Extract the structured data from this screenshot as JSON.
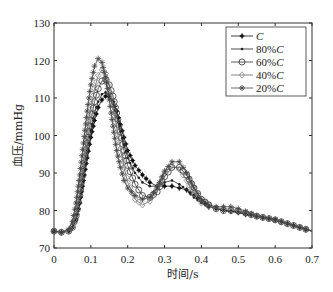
{
  "chart_data": {
    "type": "line",
    "title": "",
    "xlabel": "时间/s",
    "ylabel": "血压/mmHg",
    "xlim": [
      0,
      0.7
    ],
    "ylim": [
      70,
      130
    ],
    "xticks": [
      "0",
      "0.1",
      "0.2",
      "0.3",
      "0.4",
      "0.5",
      "0.6",
      "0.7"
    ],
    "yticks": [
      "70",
      "80",
      "90",
      "100",
      "110",
      "120",
      "130"
    ],
    "grid": false,
    "legend_position": "upper right",
    "x": [
      0,
      0.02,
      0.04,
      0.05,
      0.06,
      0.07,
      0.08,
      0.09,
      0.1,
      0.11,
      0.12,
      0.13,
      0.14,
      0.15,
      0.16,
      0.17,
      0.18,
      0.19,
      0.2,
      0.22,
      0.24,
      0.26,
      0.28,
      0.3,
      0.32,
      0.34,
      0.36,
      0.38,
      0.4,
      0.42,
      0.44,
      0.46,
      0.48,
      0.5,
      0.52,
      0.55,
      0.6,
      0.65,
      0.7
    ],
    "series": [
      {
        "name": "C",
        "marker": "dot-star",
        "values": [
          74.5,
          74.2,
          74.5,
          75.5,
          77.5,
          82,
          88,
          94,
          99.5,
          104,
          107.5,
          109.5,
          110.5,
          110.3,
          109,
          106.5,
          103,
          99.5,
          96,
          92,
          89.5,
          87.5,
          86.5,
          86.5,
          86.5,
          86,
          85.5,
          84,
          82.5,
          81,
          80.5,
          80,
          79.8,
          79.5,
          79,
          78.5,
          77.5,
          76,
          74.5
        ]
      },
      {
        "name": "80%C",
        "marker": "dot",
        "values": [
          74.5,
          74.2,
          74.5,
          75.5,
          78,
          83,
          89.5,
          96,
          101.5,
          106,
          109,
          111,
          111.5,
          110.5,
          108.5,
          105,
          101,
          97.5,
          94,
          90,
          87.5,
          86.5,
          86.5,
          87.5,
          88,
          87,
          85.5,
          83.5,
          82,
          81,
          80.5,
          80,
          79.8,
          79.5,
          79,
          78.5,
          77.5,
          76,
          74.5
        ]
      },
      {
        "name": "60%C",
        "marker": "circle",
        "values": [
          74.5,
          74.2,
          74.5,
          75.5,
          78.5,
          84,
          91,
          98,
          104,
          109,
          112.5,
          114.5,
          115,
          113.5,
          110.5,
          106,
          101,
          96,
          92,
          87,
          84,
          83.5,
          85,
          89,
          91.5,
          91.5,
          89.5,
          86,
          83,
          81.5,
          80.5,
          80,
          80,
          79.8,
          79.3,
          78.5,
          77.5,
          76,
          74.5
        ]
      },
      {
        "name": "40%C",
        "marker": "diamond",
        "values": [
          74.5,
          74.2,
          74.5,
          76,
          79,
          85.5,
          93,
          100.5,
          107,
          112.5,
          116,
          117.5,
          116.5,
          113,
          108,
          102,
          96.5,
          91.5,
          87.5,
          83,
          81.5,
          82.5,
          86,
          90,
          92,
          91,
          88,
          84.5,
          82,
          81,
          80.5,
          80.5,
          80.3,
          80,
          79.5,
          78.5,
          77.5,
          76,
          74.5
        ]
      },
      {
        "name": "20%C",
        "marker": "star",
        "values": [
          74.5,
          74.2,
          75,
          77,
          82,
          89.5,
          98,
          106.5,
          113.5,
          118.5,
          120.5,
          119.5,
          115.5,
          109.5,
          102.5,
          96,
          91.5,
          88,
          86,
          84,
          83,
          83.5,
          86,
          90.5,
          93,
          93,
          90,
          86,
          83,
          81.5,
          81,
          81,
          81,
          80.5,
          79.8,
          78.5,
          77.5,
          76,
          74.5
        ]
      }
    ]
  }
}
